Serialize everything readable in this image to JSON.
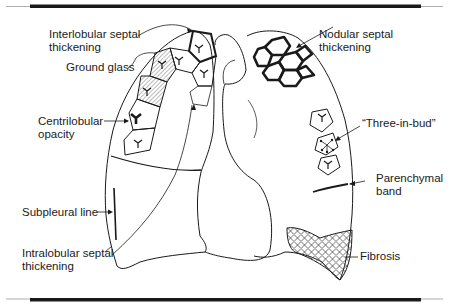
{
  "figure": {
    "labels": {
      "interlobular": "Interlobular septal\nthickening",
      "ground_glass": "Ground glass",
      "centrilobular": "Centrilobular\nopacity",
      "subpleural": "Subpleural line",
      "intralobular": "Intralobular septal\nthickening",
      "nodular": "Nodular septal\nthickening",
      "tree_in_bud": "“Three-in-bud”",
      "parenchymal": "Parenchymal\nband",
      "fibrosis": "Fibrosis"
    },
    "colors": {
      "line": "#1a1a1a",
      "bar": "#1a1a1a",
      "hatch": "#9a9a9a"
    }
  }
}
